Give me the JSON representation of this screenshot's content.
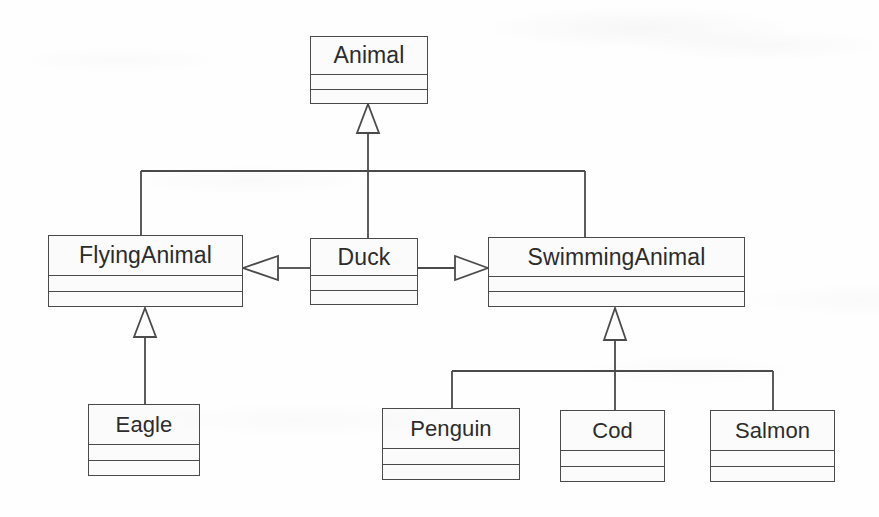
{
  "diagram": {
    "kind": "uml-class-diagram",
    "style": {
      "background": "#fefefe",
      "box_fill": "#fbfbfb",
      "line_color": "#4a4a4a",
      "text_color": "#2c2c2c"
    },
    "classes": [
      {
        "id": "animal",
        "name": "Animal",
        "x": 310,
        "y": 36,
        "w": 118,
        "h": 68,
        "name_h": 37
      },
      {
        "id": "flying_animal",
        "name": "FlyingAnimal",
        "x": 48,
        "y": 235,
        "w": 195,
        "h": 72,
        "name_h": 39
      },
      {
        "id": "duck",
        "name": "Duck",
        "x": 310,
        "y": 238,
        "w": 108,
        "h": 67,
        "name_h": 36
      },
      {
        "id": "swimming_animal",
        "name": "SwimmingAnimal",
        "x": 488,
        "y": 237,
        "w": 257,
        "h": 70,
        "name_h": 38
      },
      {
        "id": "eagle",
        "name": "Eagle",
        "x": 88,
        "y": 404,
        "w": 112,
        "h": 72,
        "name_h": 39
      },
      {
        "id": "penguin",
        "name": "Penguin",
        "x": 382,
        "y": 408,
        "w": 138,
        "h": 72,
        "name_h": 39
      },
      {
        "id": "cod",
        "name": "Cod",
        "x": 560,
        "y": 410,
        "w": 105,
        "h": 72,
        "name_h": 39
      },
      {
        "id": "salmon",
        "name": "Salmon",
        "x": 710,
        "y": 410,
        "w": 125,
        "h": 72,
        "name_h": 39
      }
    ],
    "relationships": [
      {
        "id": "r1",
        "type": "generalization",
        "from": "flying_animal",
        "to": "animal",
        "label": ""
      },
      {
        "id": "r2",
        "type": "generalization",
        "from": "duck",
        "to": "animal",
        "label": ""
      },
      {
        "id": "r3",
        "type": "generalization",
        "from": "swimming_animal",
        "to": "animal",
        "label": ""
      },
      {
        "id": "r4",
        "type": "generalization",
        "from": "eagle",
        "to": "flying_animal",
        "label": ""
      },
      {
        "id": "r5",
        "type": "generalization",
        "from": "penguin",
        "to": "swimming_animal",
        "label": ""
      },
      {
        "id": "r6",
        "type": "generalization",
        "from": "cod",
        "to": "swimming_animal",
        "label": ""
      },
      {
        "id": "r7",
        "type": "generalization",
        "from": "salmon",
        "to": "swimming_animal",
        "label": ""
      },
      {
        "id": "r8",
        "type": "realization",
        "from": "duck",
        "to": "flying_animal",
        "label": ""
      },
      {
        "id": "r9",
        "type": "realization",
        "from": "duck",
        "to": "swimming_animal",
        "label": ""
      }
    ]
  }
}
